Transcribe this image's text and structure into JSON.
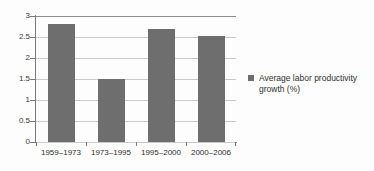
{
  "chart_data": {
    "type": "bar",
    "title": "",
    "subtitle": "",
    "xlabel": "",
    "ylabel": "",
    "categories": [
      "1959–1973",
      "1973–1995",
      "1995–2000",
      "2000–2006"
    ],
    "values": [
      2.8,
      1.5,
      2.7,
      2.53
    ],
    "series": [
      {
        "name": "Average labor productivity growth (%)",
        "values": [
          2.8,
          1.5,
          2.7,
          2.53
        ]
      }
    ],
    "ylim": [
      0,
      3
    ],
    "ytick_labels": [
      "0",
      "0.5",
      "1",
      "1.5",
      "2",
      "2.5",
      "3"
    ],
    "ytick_values": [
      0,
      0.5,
      1,
      1.5,
      2,
      2.5,
      3
    ],
    "grid": true,
    "legend_position": "right",
    "legend_entries": [
      "Average labor productivity growth (%)"
    ],
    "annotations": [],
    "colors": {
      "bar": "#6e6e6e",
      "gridline": "#c9c9c9",
      "axis": "#7a7a7a",
      "text": "#2f2f2f",
      "background": "#fdfdfd"
    }
  },
  "legend": {
    "swatch_name": "legend-color-swatch",
    "label": "Average labor productivity growth (%)"
  }
}
